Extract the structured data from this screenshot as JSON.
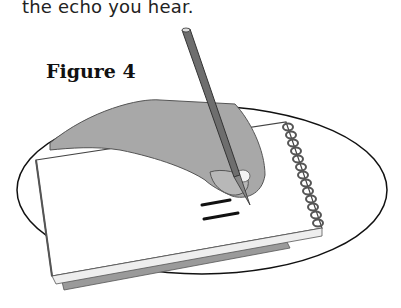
{
  "document": {
    "body_text": "the echo you hear.",
    "figure_caption": "Figure 4"
  },
  "illustration": {
    "description": "Hand holding a pencil writing two horizontal lines (equal sign) on a spiral notepad, inside an oval",
    "icons": [
      "hand-icon",
      "pencil-icon",
      "spiral-notepad-icon",
      "oval-frame"
    ],
    "colors": {
      "hand": "#a8a8a8",
      "pencil": "#6e6e6e",
      "outline": "#1a1a1a",
      "paper": "#ffffff",
      "notepad_back": "#9a9a9a"
    }
  }
}
